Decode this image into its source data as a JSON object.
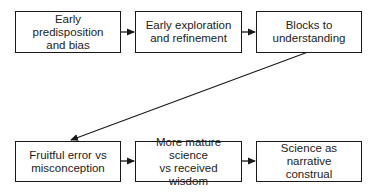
{
  "diagram": {
    "type": "flowchart",
    "rows": [
      {
        "nodes": [
          {
            "id": "n1",
            "label": "Early predisposition\nand bias"
          },
          {
            "id": "n2",
            "label": "Early exploration\nand refinement"
          },
          {
            "id": "n3",
            "label": "Blocks to\nunderstanding"
          }
        ]
      },
      {
        "nodes": [
          {
            "id": "n4",
            "label": "Fruitful error vs\nmisconception"
          },
          {
            "id": "n5",
            "label": "More mature science\nvs received wisdom"
          },
          {
            "id": "n6",
            "label": "Science as narrative\nconstrual"
          }
        ]
      }
    ],
    "edges": [
      {
        "from": "n1",
        "to": "n2"
      },
      {
        "from": "n2",
        "to": "n3"
      },
      {
        "from": "n3",
        "to": "n4"
      },
      {
        "from": "n4",
        "to": "n5"
      },
      {
        "from": "n5",
        "to": "n6"
      }
    ],
    "colors": {
      "stroke": "#1a1a1a",
      "text": "#222222",
      "background": "#ffffff"
    }
  }
}
